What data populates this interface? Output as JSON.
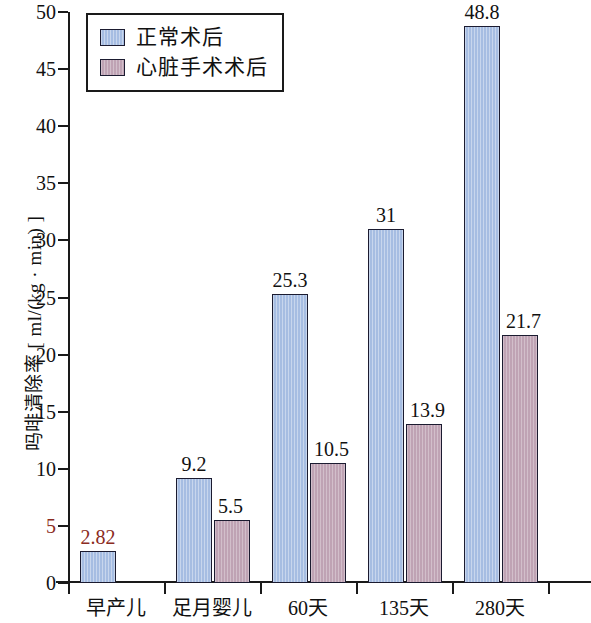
{
  "chart_data": {
    "type": "bar",
    "title": "",
    "xlabel": "",
    "ylabel": "吗啡清除率 [ ml/(kg · min) ]",
    "categories": [
      "早产儿",
      "足月婴儿",
      "60天",
      "135天",
      "280天"
    ],
    "series": [
      {
        "name": "正常术后",
        "color": "#a6bde2",
        "values": [
          2.82,
          9.2,
          25.3,
          31,
          48.8
        ],
        "labels": [
          "2.82",
          "9.2",
          "25.3",
          "31",
          "48.8"
        ]
      },
      {
        "name": "心脏手术术后",
        "color": "#bfa3b4",
        "values": [
          null,
          5.5,
          10.5,
          13.9,
          21.7
        ],
        "labels": [
          "",
          "5.5",
          "10.5",
          "13.9",
          "21.7"
        ]
      }
    ],
    "ylim": [
      0,
      50
    ],
    "yticks": [
      0,
      5,
      10,
      15,
      20,
      25,
      30,
      35,
      40,
      45,
      50
    ],
    "ytick_labels": [
      "0",
      "5",
      "10",
      "15",
      "20",
      "25",
      "30",
      "35",
      "40",
      "45",
      "50"
    ],
    "grid": false,
    "legend_position": "top-left"
  },
  "legend": {
    "entries": [
      {
        "label": "正常术后"
      },
      {
        "label": "心脏手术术后"
      }
    ]
  }
}
